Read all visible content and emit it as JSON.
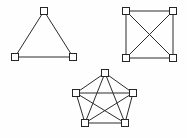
{
  "figure": {
    "title": "Complete graphs K3, K4 and K5",
    "background_color": "#fefefe",
    "edge_color": "#2b2b2b",
    "node_fill_color": "#ffffff",
    "node_stroke_color": "#262626",
    "node_size": 7,
    "width": 187,
    "height": 138
  },
  "chart_data": {
    "type": "diagram",
    "title": "Complete graphs K3, K4 and K5",
    "graphs": [
      {
        "id": "k3",
        "label": "K3",
        "node_count": 3,
        "edge_count": 3,
        "nodes": [
          {
            "id": "a",
            "x": 44,
            "y": 11
          },
          {
            "id": "b",
            "x": 15,
            "y": 57
          },
          {
            "id": "c",
            "x": 73,
            "y": 57
          }
        ],
        "edges": [
          [
            "a",
            "b"
          ],
          [
            "a",
            "c"
          ],
          [
            "b",
            "c"
          ]
        ]
      },
      {
        "id": "k4",
        "label": "K4",
        "node_count": 4,
        "edge_count": 6,
        "nodes": [
          {
            "id": "a",
            "x": 126,
            "y": 11
          },
          {
            "id": "b",
            "x": 173,
            "y": 11
          },
          {
            "id": "c",
            "x": 126,
            "y": 58
          },
          {
            "id": "d",
            "x": 173,
            "y": 58
          }
        ],
        "edges": [
          [
            "a",
            "b"
          ],
          [
            "a",
            "c"
          ],
          [
            "a",
            "d"
          ],
          [
            "b",
            "c"
          ],
          [
            "b",
            "d"
          ],
          [
            "c",
            "d"
          ]
        ]
      },
      {
        "id": "k5",
        "label": "K5",
        "node_count": 5,
        "edge_count": 10,
        "nodes": [
          {
            "id": "a",
            "x": 105,
            "y": 73
          },
          {
            "id": "b",
            "x": 76,
            "y": 93
          },
          {
            "id": "c",
            "x": 133,
            "y": 93
          },
          {
            "id": "d",
            "x": 85,
            "y": 123
          },
          {
            "id": "e",
            "x": 125,
            "y": 123
          }
        ],
        "edges": [
          [
            "a",
            "b"
          ],
          [
            "a",
            "c"
          ],
          [
            "a",
            "d"
          ],
          [
            "a",
            "e"
          ],
          [
            "b",
            "c"
          ],
          [
            "b",
            "d"
          ],
          [
            "b",
            "e"
          ],
          [
            "c",
            "d"
          ],
          [
            "c",
            "e"
          ],
          [
            "d",
            "e"
          ]
        ]
      }
    ]
  }
}
